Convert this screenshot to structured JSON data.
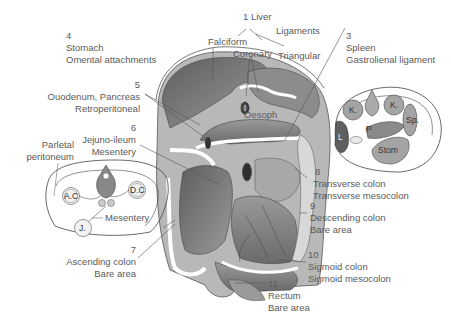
{
  "labels": {
    "liver": {
      "num": "1",
      "name": "Liver",
      "sub": [
        "Falciform",
        "Coronary",
        "Ligaments",
        "Triangular"
      ]
    },
    "oesophagus": {
      "num": "2",
      "name": "Oesoph"
    },
    "spleen": {
      "num": "3",
      "name": "Spleen",
      "attachment": "Gastrolienal ligament"
    },
    "stomach": {
      "num": "4",
      "name": "Stomach",
      "attachment": "Omental attachments"
    },
    "duodenum": {
      "num": "5",
      "name": "Ouodenum, Pancreas",
      "attachment": "Retroperitoneal"
    },
    "jejunoileum": {
      "num": "6",
      "name": "Jejuno-ileum",
      "attachment": "Mesentery"
    },
    "ascending_colon": {
      "num": "7",
      "name": "Ascending colon",
      "attachment": "Bare area"
    },
    "transverse_colon": {
      "num": "8",
      "name": "Transverse colon",
      "attachment": "Transverse mesocolon"
    },
    "descending_colon": {
      "num": "9",
      "name": "Descending colon",
      "attachment": "Bare area"
    },
    "sigmoid_colon": {
      "num": "10",
      "name": "Sigmoid colon",
      "attachment": "Sigmoid mesocolon"
    },
    "rectum": {
      "num": "11",
      "name": "Rectum",
      "attachment": "Bare area"
    }
  },
  "inset_left": {
    "parietal_line1": "Parletal",
    "parietal_line2": "peritoneum",
    "ac": "A.C",
    "dc": "D.C",
    "j": "J.",
    "mesentery": "Mesentery"
  },
  "inset_right": {
    "k_left": "K.",
    "k_right": "K.",
    "l": "L",
    "p": "P",
    "sp": "Sp.",
    "stom": "Stom"
  },
  "colors": {
    "dark": "#6e6e6e",
    "mid": "#8f8f8f",
    "light": "#b9b9b9",
    "pale": "#d4d4d4",
    "line": "#444444"
  }
}
